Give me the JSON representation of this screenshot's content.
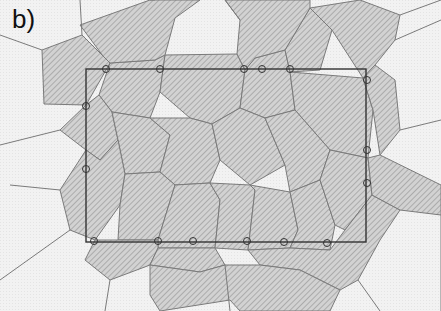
{
  "figure": {
    "panel_label": "b)",
    "colors": {
      "background": "#f4f4f4",
      "shaded_fill": "#c8c8c8",
      "hatch_line": "#9a9a9a",
      "cell_edge": "#7a7a7a",
      "rectangle": "#333333",
      "marker": "#333333"
    },
    "rectangle": {
      "x": 86,
      "y": 69,
      "w": 280,
      "h": 173
    },
    "shaded_cells": [
      [
        [
          42,
          50
        ],
        [
          82,
          35
        ],
        [
          103,
          56
        ],
        [
          110,
          63
        ],
        [
          86,
          105
        ],
        [
          44,
          104
        ]
      ],
      [
        [
          110,
          63
        ],
        [
          155,
          60
        ],
        [
          165,
          55
        ],
        [
          160,
          92
        ],
        [
          150,
          118
        ],
        [
          112,
          112
        ],
        [
          99,
          95
        ]
      ],
      [
        [
          165,
          55
        ],
        [
          237,
          54
        ],
        [
          245,
          70
        ],
        [
          240,
          108
        ],
        [
          212,
          124
        ],
        [
          190,
          118
        ],
        [
          160,
          92
        ]
      ],
      [
        [
          245,
          70
        ],
        [
          255,
          58
        ],
        [
          285,
          50
        ],
        [
          290,
          72
        ],
        [
          295,
          110
        ],
        [
          265,
          118
        ],
        [
          240,
          108
        ]
      ],
      [
        [
          285,
          50
        ],
        [
          310,
          8
        ],
        [
          332,
          30
        ],
        [
          320,
          70
        ],
        [
          290,
          72
        ]
      ],
      [
        [
          290,
          72
        ],
        [
          363,
          78
        ],
        [
          373,
          110
        ],
        [
          368,
          158
        ],
        [
          330,
          150
        ],
        [
          295,
          110
        ]
      ],
      [
        [
          86,
          105
        ],
        [
          99,
          95
        ],
        [
          112,
          112
        ],
        [
          118,
          140
        ],
        [
          100,
          160
        ],
        [
          86,
          150
        ],
        [
          60,
          130
        ]
      ],
      [
        [
          112,
          112
        ],
        [
          150,
          118
        ],
        [
          170,
          135
        ],
        [
          160,
          172
        ],
        [
          125,
          174
        ],
        [
          118,
          140
        ]
      ],
      [
        [
          150,
          118
        ],
        [
          190,
          118
        ],
        [
          212,
          124
        ],
        [
          220,
          160
        ],
        [
          210,
          183
        ],
        [
          175,
          185
        ],
        [
          160,
          172
        ],
        [
          170,
          135
        ]
      ],
      [
        [
          212,
          124
        ],
        [
          240,
          108
        ],
        [
          265,
          118
        ],
        [
          285,
          165
        ],
        [
          250,
          185
        ],
        [
          220,
          160
        ]
      ],
      [
        [
          265,
          118
        ],
        [
          295,
          110
        ],
        [
          330,
          150
        ],
        [
          320,
          180
        ],
        [
          290,
          192
        ],
        [
          285,
          165
        ]
      ],
      [
        [
          86,
          150
        ],
        [
          100,
          160
        ],
        [
          118,
          140
        ],
        [
          125,
          174
        ],
        [
          120,
          205
        ],
        [
          95,
          240
        ],
        [
          70,
          230
        ],
        [
          60,
          190
        ]
      ],
      [
        [
          125,
          174
        ],
        [
          160,
          172
        ],
        [
          175,
          185
        ],
        [
          158,
          240
        ],
        [
          118,
          240
        ],
        [
          120,
          205
        ]
      ],
      [
        [
          175,
          185
        ],
        [
          210,
          183
        ],
        [
          220,
          200
        ],
        [
          215,
          248
        ],
        [
          158,
          248
        ],
        [
          158,
          240
        ]
      ],
      [
        [
          210,
          183
        ],
        [
          250,
          185
        ],
        [
          255,
          190
        ],
        [
          248,
          250
        ],
        [
          215,
          248
        ],
        [
          220,
          200
        ]
      ],
      [
        [
          250,
          185
        ],
        [
          290,
          192
        ],
        [
          298,
          230
        ],
        [
          290,
          248
        ],
        [
          248,
          250
        ],
        [
          255,
          190
        ]
      ],
      [
        [
          290,
          192
        ],
        [
          320,
          180
        ],
        [
          335,
          225
        ],
        [
          330,
          250
        ],
        [
          290,
          248
        ],
        [
          298,
          230
        ]
      ],
      [
        [
          330,
          150
        ],
        [
          368,
          158
        ],
        [
          372,
          195
        ],
        [
          345,
          230
        ],
        [
          335,
          225
        ],
        [
          320,
          180
        ]
      ],
      [
        [
          95,
          240
        ],
        [
          118,
          240
        ],
        [
          158,
          240
        ],
        [
          158,
          248
        ],
        [
          150,
          265
        ],
        [
          110,
          280
        ],
        [
          85,
          260
        ]
      ],
      [
        [
          158,
          248
        ],
        [
          215,
          248
        ],
        [
          225,
          265
        ],
        [
          200,
          272
        ],
        [
          150,
          265
        ]
      ],
      [
        [
          248,
          250
        ],
        [
          290,
          248
        ],
        [
          330,
          250
        ],
        [
          345,
          230
        ],
        [
          372,
          195
        ],
        [
          400,
          210
        ],
        [
          380,
          240
        ],
        [
          358,
          280
        ],
        [
          340,
          290
        ],
        [
          300,
          270
        ],
        [
          260,
          265
        ]
      ],
      [
        [
          80,
          25
        ],
        [
          150,
          0
        ],
        [
          200,
          0
        ],
        [
          175,
          18
        ],
        [
          165,
          55
        ],
        [
          155,
          60
        ],
        [
          110,
          63
        ],
        [
          103,
          56
        ]
      ],
      [
        [
          225,
          0
        ],
        [
          310,
          0
        ],
        [
          310,
          8
        ],
        [
          285,
          50
        ],
        [
          255,
          58
        ],
        [
          245,
          70
        ],
        [
          237,
          54
        ],
        [
          240,
          20
        ]
      ],
      [
        [
          310,
          8
        ],
        [
          360,
          0
        ],
        [
          400,
          15
        ],
        [
          395,
          40
        ],
        [
          375,
          65
        ],
        [
          363,
          78
        ],
        [
          332,
          30
        ]
      ],
      [
        [
          363,
          78
        ],
        [
          375,
          65
        ],
        [
          395,
          80
        ],
        [
          400,
          130
        ],
        [
          380,
          155
        ],
        [
          373,
          110
        ]
      ],
      [
        [
          368,
          158
        ],
        [
          380,
          155
        ],
        [
          441,
          185
        ],
        [
          441,
          215
        ],
        [
          400,
          210
        ],
        [
          372,
          195
        ]
      ],
      [
        [
          150,
          265
        ],
        [
          200,
          272
        ],
        [
          225,
          265
        ],
        [
          260,
          265
        ],
        [
          300,
          270
        ],
        [
          340,
          290
        ],
        [
          330,
          311
        ],
        [
          240,
          311
        ],
        [
          230,
          300
        ],
        [
          160,
          311
        ],
        [
          150,
          295
        ]
      ]
    ],
    "edges": [
      [
        [
          0,
          35
        ],
        [
          42,
          50
        ]
      ],
      [
        [
          82,
          35
        ],
        [
          80,
          0
        ]
      ],
      [
        [
          155,
          0
        ],
        [
          150,
          0
        ]
      ],
      [
        [
          240,
          20
        ],
        [
          225,
          0
        ]
      ],
      [
        [
          400,
          15
        ],
        [
          441,
          0
        ]
      ],
      [
        [
          395,
          40
        ],
        [
          441,
          20
        ]
      ],
      [
        [
          400,
          130
        ],
        [
          441,
          120
        ]
      ],
      [
        [
          60,
          130
        ],
        [
          0,
          145
        ]
      ],
      [
        [
          60,
          190
        ],
        [
          10,
          185
        ]
      ],
      [
        [
          70,
          230
        ],
        [
          0,
          280
        ]
      ],
      [
        [
          110,
          280
        ],
        [
          105,
          311
        ]
      ],
      [
        [
          225,
          265
        ],
        [
          230,
          311
        ]
      ],
      [
        [
          358,
          280
        ],
        [
          380,
          311
        ]
      ],
      [
        [
          441,
          215
        ],
        [
          441,
          311
        ]
      ]
    ],
    "markers": [
      [
        106,
        69
      ],
      [
        160,
        69
      ],
      [
        244,
        69
      ],
      [
        262,
        69
      ],
      [
        290,
        69
      ],
      [
        86,
        106
      ],
      [
        367,
        80
      ],
      [
        86,
        169
      ],
      [
        367,
        150
      ],
      [
        367,
        183
      ],
      [
        94,
        241
      ],
      [
        158,
        241
      ],
      [
        193,
        241
      ],
      [
        247,
        241
      ],
      [
        284,
        242
      ],
      [
        327,
        243
      ]
    ]
  }
}
